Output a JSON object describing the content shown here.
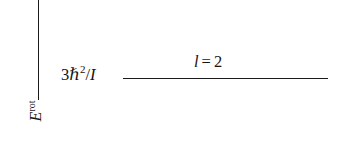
{
  "figure": {
    "type": "energy-level-diagram",
    "background_color": "#ffffff",
    "ink_color": "#1b1b1b",
    "axis": {
      "orientation": "vertical",
      "label_base": "E",
      "label_superscript": "rot",
      "label_full": "E^rot",
      "x_px": 38,
      "top_px": 0,
      "bottom_px": 100
    },
    "levels": [
      {
        "energy_label": {
          "coefficient": "3",
          "symbol": "ℏ",
          "exponent": "2",
          "slash": "/",
          "moment_of_inertia": "I",
          "full": "3ℏ²/I"
        },
        "quantum_label": {
          "symbol": "l",
          "relation": "=",
          "value": "2",
          "full": "l = 2"
        },
        "line": {
          "left_px": 123,
          "right_px": 328,
          "y_px": 78,
          "thickness_px": 1.7
        }
      }
    ]
  }
}
